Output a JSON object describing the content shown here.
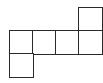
{
  "diagram": {
    "type": "cube-net",
    "cell_size_px": 23,
    "origin_px": [
      9,
      7
    ],
    "stroke_color": "#2a2a2a",
    "fill_color": "#ffffff",
    "squares": [
      {
        "row": 0,
        "col": 3
      },
      {
        "row": 1,
        "col": 0
      },
      {
        "row": 1,
        "col": 1
      },
      {
        "row": 1,
        "col": 2
      },
      {
        "row": 1,
        "col": 3
      },
      {
        "row": 2,
        "col": 0
      }
    ]
  }
}
